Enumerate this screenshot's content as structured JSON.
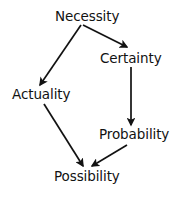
{
  "diagram": {
    "background_color": "#ffffff",
    "stroke_color": "#121212",
    "text_color": "#121212",
    "nodes": [
      {
        "id": "necessity",
        "label": "Necessity",
        "x": 88,
        "y": 17
      },
      {
        "id": "certainty",
        "label": "Certainty",
        "x": 130,
        "y": 59
      },
      {
        "id": "actuality",
        "label": "Actuality",
        "x": 41,
        "y": 95
      },
      {
        "id": "probability",
        "label": "Probability",
        "x": 133,
        "y": 135
      },
      {
        "id": "possibility",
        "label": "Possibility",
        "x": 88,
        "y": 177
      }
    ],
    "edges": [
      {
        "id": "necessity-to-actuality",
        "from": "Necessity",
        "to": "Actuality",
        "x1": 81,
        "y1": 25,
        "x2": 40,
        "y2": 85
      },
      {
        "id": "necessity-to-certainty",
        "from": "Necessity",
        "to": "Certainty",
        "x1": 83,
        "y1": 25,
        "x2": 127,
        "y2": 47
      },
      {
        "id": "certainty-to-probability",
        "from": "Certainty",
        "to": "Probability",
        "x1": 131,
        "y1": 67,
        "x2": 131,
        "y2": 125
      },
      {
        "id": "actuality-to-possibility",
        "from": "Actuality",
        "to": "Possibility",
        "x1": 44,
        "y1": 104,
        "x2": 83,
        "y2": 167
      },
      {
        "id": "probability-to-possibility",
        "from": "Probability",
        "to": "Possibility",
        "x1": 127,
        "y1": 145,
        "x2": 92,
        "y2": 167
      }
    ]
  }
}
